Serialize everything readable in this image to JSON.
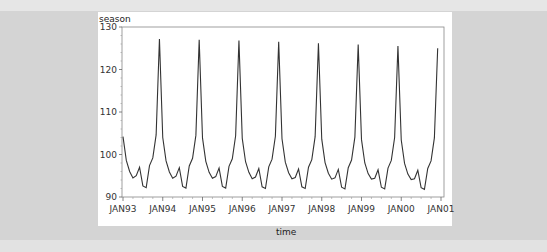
{
  "chart_data": {
    "type": "line",
    "title": "",
    "xlabel": "time",
    "ylabel": "season",
    "ylim": [
      90,
      130
    ],
    "yticks": [
      90,
      100,
      110,
      120,
      130
    ],
    "xticks": [
      "JAN93",
      "JAN94",
      "JAN95",
      "JAN96",
      "JAN97",
      "JAN98",
      "JAN99",
      "JAN00",
      "JAN01"
    ],
    "grid": false,
    "legend": null,
    "x_start": "JAN93",
    "x_end": "DEC00",
    "frequency": "monthly",
    "series": [
      {
        "name": "season",
        "color": "#333333",
        "values": [
          104.2,
          98.6,
          96.0,
          94.5,
          95.0,
          97.0,
          92.6,
          92.2,
          97.4,
          99.2,
          104.6,
          127.2,
          104.0,
          98.5,
          95.9,
          94.4,
          94.9,
          96.9,
          92.5,
          92.1,
          97.3,
          99.1,
          104.5,
          127.0,
          103.9,
          98.4,
          95.8,
          94.4,
          94.8,
          96.8,
          92.5,
          92.1,
          97.2,
          99.0,
          104.4,
          126.8,
          103.8,
          98.3,
          95.8,
          94.3,
          94.7,
          96.7,
          92.4,
          92.0,
          97.1,
          98.9,
          104.3,
          126.5,
          103.7,
          98.2,
          95.7,
          94.3,
          94.6,
          96.6,
          92.4,
          92.0,
          97.0,
          98.8,
          104.2,
          126.2,
          103.6,
          98.1,
          95.6,
          94.2,
          94.5,
          96.5,
          92.3,
          91.9,
          96.9,
          98.7,
          104.1,
          125.9,
          103.5,
          98.0,
          95.5,
          94.2,
          94.4,
          96.4,
          92.3,
          91.9,
          96.8,
          98.6,
          104.0,
          125.5,
          103.4,
          97.9,
          95.4,
          94.1,
          94.3,
          96.3,
          92.2,
          91.8,
          96.7,
          98.5,
          103.9,
          125.0
        ]
      }
    ]
  },
  "axes": {
    "y_title": "season",
    "x_title": "time",
    "y_tick_labels": [
      "90",
      "100",
      "110",
      "120",
      "130"
    ],
    "x_tick_labels": [
      "JAN93",
      "JAN94",
      "JAN95",
      "JAN96",
      "JAN97",
      "JAN98",
      "JAN99",
      "JAN00",
      "JAN01"
    ]
  }
}
